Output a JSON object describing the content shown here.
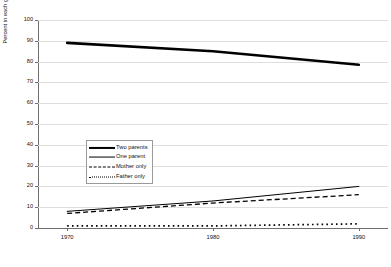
{
  "chart_data": {
    "type": "line",
    "title": "",
    "xlabel": "",
    "ylabel": "Percent in each group",
    "x": [
      1970,
      1980,
      1990
    ],
    "xlim": [
      1968,
      1992
    ],
    "ylim": [
      0,
      100
    ],
    "grid": true,
    "legend_position": "center-left",
    "xtick_labels": [
      "1970",
      "1980",
      "1990"
    ],
    "ytick_labels": [
      "0",
      "10",
      "20",
      "30",
      "40",
      "50",
      "60",
      "70",
      "80",
      "90",
      "100"
    ],
    "ytick_values": [
      0,
      10,
      20,
      30,
      40,
      50,
      60,
      70,
      80,
      90,
      100
    ],
    "series": [
      {
        "name": "Two parents",
        "style": "thick-solid",
        "color": "#000000",
        "values": [
          89,
          85,
          78.5
        ]
      },
      {
        "name": "One parent",
        "style": "thin-solid",
        "color": "#000000",
        "values": [
          8,
          13,
          20
        ]
      },
      {
        "name": "Mother only",
        "style": "dashed",
        "color": "#000000",
        "values": [
          7,
          12,
          16
        ]
      },
      {
        "name": "Father only",
        "style": "dotted",
        "color": "#000000",
        "values": [
          1,
          1,
          2
        ]
      }
    ]
  },
  "legend": {
    "items": [
      {
        "label": "Two parents"
      },
      {
        "label": "One parent"
      },
      {
        "label": "Mother only"
      },
      {
        "label": "Father only"
      }
    ]
  }
}
